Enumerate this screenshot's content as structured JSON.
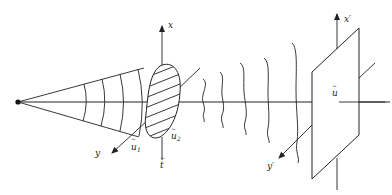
{
  "diagram": {
    "type": "optics-propagation-schematic",
    "labels": {
      "axis_x": "x",
      "axis_y": "y",
      "axis_t": "t",
      "tilde": "~",
      "u1": "u",
      "u1_sub": "1",
      "u2": "u",
      "u2_sub": "2",
      "axis_x_prime": "x′",
      "axis_y_prime": "y′",
      "u_plane": "u"
    },
    "colors": {
      "stroke": "#222222",
      "background": "#ffffff"
    },
    "elements": [
      "point-source",
      "cone-of-rays",
      "spherical-wavefronts",
      "optical-axis",
      "hatched-aperture",
      "input-axes",
      "propagating-wavefronts",
      "observation-plane",
      "output-axes"
    ]
  }
}
